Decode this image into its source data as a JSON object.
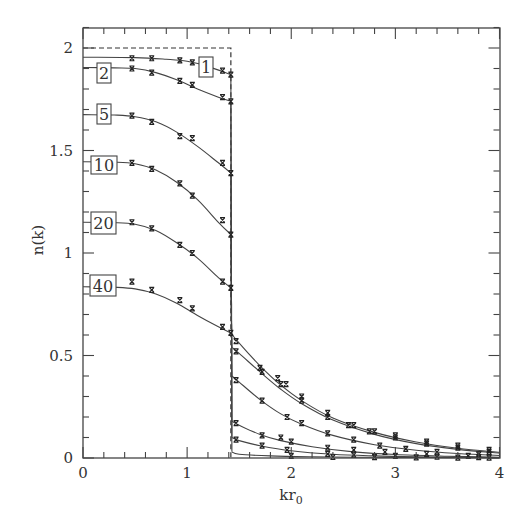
{
  "chart_data": {
    "type": "line",
    "title": "",
    "xlabel": "kr0",
    "xlabel_main": "kr",
    "xlabel_sub": "0",
    "ylabel": "n(k)",
    "xlim": [
      0,
      4
    ],
    "ylim": [
      0,
      2.1
    ],
    "grid": false,
    "legend": "inline boxed labels at left of each curve",
    "x_ticks": [
      0,
      1,
      2,
      3,
      4
    ],
    "x_tick_labels": [
      "0",
      "1",
      "2",
      "3",
      "4"
    ],
    "y_ticks": [
      0,
      0.5,
      1,
      1.5,
      2
    ],
    "y_tick_labels": [
      "0",
      "0.5",
      "1",
      "1.5",
      "2"
    ],
    "x_minor_step": 0.2,
    "y_minor_step": 0.1,
    "reference_step": {
      "description": "dashed step function (free Fermi distribution)",
      "height": 2.0,
      "kF": 1.42
    },
    "series": [
      {
        "name": "1",
        "label_pos": {
          "x": 199,
          "y": 57,
          "w": 14,
          "h": 20
        },
        "curve_below": [
          [
            0,
            1.955
          ],
          [
            0.5,
            1.953
          ],
          [
            0.8,
            1.945
          ],
          [
            1.0,
            1.935
          ],
          [
            1.2,
            1.91
          ],
          [
            1.42,
            1.87
          ]
        ],
        "curve_above": [
          [
            1.43,
            0.03
          ],
          [
            1.5,
            0.018
          ],
          [
            1.8,
            0.01
          ],
          [
            2.2,
            0.006
          ],
          [
            2.6,
            0.004
          ],
          [
            3.0,
            0.003
          ],
          [
            3.5,
            0.002
          ],
          [
            4.0,
            0.001
          ]
        ],
        "points": [
          [
            0.47,
            1.95
          ],
          [
            0.66,
            1.95
          ],
          [
            0.93,
            1.94
          ],
          [
            1.05,
            1.93
          ],
          [
            1.34,
            1.89
          ],
          [
            1.42,
            1.87
          ],
          [
            2.0,
            0.01
          ],
          [
            2.4,
            0.005
          ],
          [
            2.8,
            0.004
          ],
          [
            3.2,
            0.003
          ],
          [
            3.6,
            0.002
          ],
          [
            3.9,
            0.002
          ]
        ]
      },
      {
        "name": "2",
        "label_pos": {
          "x": 97,
          "y": 63,
          "w": 14,
          "h": 20
        },
        "curve_below": [
          [
            0,
            1.905
          ],
          [
            0.3,
            1.903
          ],
          [
            0.5,
            1.9
          ],
          [
            0.7,
            1.88
          ],
          [
            0.9,
            1.845
          ],
          [
            1.1,
            1.8
          ],
          [
            1.3,
            1.76
          ],
          [
            1.42,
            1.74
          ]
        ],
        "curve_above": [
          [
            1.43,
            0.1
          ],
          [
            1.5,
            0.085
          ],
          [
            1.7,
            0.06
          ],
          [
            2.0,
            0.035
          ],
          [
            2.4,
            0.018
          ],
          [
            2.8,
            0.01
          ],
          [
            3.2,
            0.006
          ],
          [
            3.6,
            0.004
          ],
          [
            4.0,
            0.002
          ]
        ],
        "points": [
          [
            0.47,
            1.9
          ],
          [
            0.66,
            1.88
          ],
          [
            0.93,
            1.84
          ],
          [
            1.05,
            1.82
          ],
          [
            1.34,
            1.76
          ],
          [
            1.42,
            1.74
          ],
          [
            1.47,
            0.09
          ],
          [
            1.72,
            0.06
          ],
          [
            1.96,
            0.04
          ],
          [
            2.35,
            0.02
          ],
          [
            2.6,
            0.015
          ],
          [
            3.0,
            0.01
          ],
          [
            3.4,
            0.006
          ],
          [
            3.8,
            0.004
          ]
        ]
      },
      {
        "name": "5",
        "label_pos": {
          "x": 97,
          "y": 104,
          "w": 14,
          "h": 20
        },
        "curve_below": [
          [
            0,
            1.675
          ],
          [
            0.3,
            1.673
          ],
          [
            0.5,
            1.665
          ],
          [
            0.7,
            1.64
          ],
          [
            0.9,
            1.59
          ],
          [
            1.1,
            1.52
          ],
          [
            1.3,
            1.44
          ],
          [
            1.42,
            1.39
          ]
        ],
        "curve_above": [
          [
            1.43,
            0.18
          ],
          [
            1.5,
            0.16
          ],
          [
            1.7,
            0.115
          ],
          [
            1.9,
            0.085
          ],
          [
            2.2,
            0.055
          ],
          [
            2.6,
            0.03
          ],
          [
            3.0,
            0.017
          ],
          [
            3.5,
            0.009
          ],
          [
            4.0,
            0.004
          ]
        ],
        "points": [
          [
            0.47,
            1.67
          ],
          [
            0.66,
            1.64
          ],
          [
            0.93,
            1.57
          ],
          [
            1.05,
            1.56
          ],
          [
            1.34,
            1.44
          ],
          [
            1.42,
            1.39
          ],
          [
            1.47,
            0.17
          ],
          [
            1.72,
            0.11
          ],
          [
            1.9,
            0.1
          ],
          [
            2.0,
            0.08
          ],
          [
            2.35,
            0.05
          ],
          [
            2.6,
            0.04
          ],
          [
            2.9,
            0.03
          ],
          [
            3.3,
            0.02
          ],
          [
            3.7,
            0.01
          ]
        ]
      },
      {
        "name": "10",
        "label_pos": {
          "x": 91,
          "y": 156,
          "w": 26,
          "h": 18
        },
        "curve_below": [
          [
            0,
            1.445
          ],
          [
            0.3,
            1.443
          ],
          [
            0.5,
            1.435
          ],
          [
            0.7,
            1.405
          ],
          [
            0.9,
            1.345
          ],
          [
            1.1,
            1.26
          ],
          [
            1.3,
            1.15
          ],
          [
            1.42,
            1.09
          ]
        ],
        "curve_above": [
          [
            1.43,
            0.4
          ],
          [
            1.5,
            0.37
          ],
          [
            1.7,
            0.285
          ],
          [
            1.9,
            0.215
          ],
          [
            2.1,
            0.165
          ],
          [
            2.4,
            0.11
          ],
          [
            2.8,
            0.065
          ],
          [
            3.2,
            0.038
          ],
          [
            3.6,
            0.022
          ],
          [
            4.0,
            0.012
          ]
        ],
        "points": [
          [
            0.47,
            1.44
          ],
          [
            0.66,
            1.41
          ],
          [
            0.93,
            1.34
          ],
          [
            1.05,
            1.28
          ],
          [
            1.34,
            1.16
          ],
          [
            1.42,
            1.09
          ],
          [
            1.47,
            0.38
          ],
          [
            1.72,
            0.28
          ],
          [
            1.96,
            0.2
          ],
          [
            2.1,
            0.17
          ],
          [
            2.35,
            0.12
          ],
          [
            2.6,
            0.09
          ],
          [
            2.85,
            0.06
          ],
          [
            3.1,
            0.045
          ],
          [
            3.4,
            0.03
          ],
          [
            3.8,
            0.018
          ]
        ]
      },
      {
        "name": "20",
        "label_pos": {
          "x": 91,
          "y": 212,
          "w": 25,
          "h": 22
        },
        "curve_below": [
          [
            0,
            1.15
          ],
          [
            0.3,
            1.148
          ],
          [
            0.5,
            1.14
          ],
          [
            0.7,
            1.11
          ],
          [
            0.9,
            1.05
          ],
          [
            1.1,
            0.975
          ],
          [
            1.3,
            0.88
          ],
          [
            1.42,
            0.83
          ]
        ],
        "curve_above": [
          [
            1.43,
            0.54
          ],
          [
            1.5,
            0.51
          ],
          [
            1.7,
            0.42
          ],
          [
            1.9,
            0.335
          ],
          [
            2.1,
            0.265
          ],
          [
            2.4,
            0.185
          ],
          [
            2.8,
            0.115
          ],
          [
            3.2,
            0.07
          ],
          [
            3.6,
            0.042
          ],
          [
            4.0,
            0.024
          ]
        ],
        "points": [
          [
            0.47,
            1.15
          ],
          [
            0.66,
            1.12
          ],
          [
            0.93,
            1.04
          ],
          [
            1.05,
            1.0
          ],
          [
            1.34,
            0.86
          ],
          [
            1.42,
            0.83
          ],
          [
            1.47,
            0.52
          ],
          [
            1.72,
            0.42
          ],
          [
            1.9,
            0.36
          ],
          [
            2.1,
            0.28
          ],
          [
            2.35,
            0.2
          ],
          [
            2.55,
            0.16
          ],
          [
            2.75,
            0.13
          ],
          [
            3.0,
            0.1
          ],
          [
            3.3,
            0.07
          ],
          [
            3.6,
            0.05
          ],
          [
            3.9,
            0.03
          ]
        ]
      },
      {
        "name": "40",
        "label_pos": {
          "x": 90,
          "y": 275,
          "w": 26,
          "h": 21
        },
        "curve_below": [
          [
            0,
            0.835
          ],
          [
            0.3,
            0.833
          ],
          [
            0.5,
            0.825
          ],
          [
            0.7,
            0.8
          ],
          [
            0.9,
            0.755
          ],
          [
            1.1,
            0.695
          ],
          [
            1.3,
            0.64
          ],
          [
            1.42,
            0.61
          ]
        ],
        "curve_above": [
          [
            1.42,
            0.61
          ],
          [
            1.5,
            0.56
          ],
          [
            1.7,
            0.45
          ],
          [
            1.9,
            0.355
          ],
          [
            2.1,
            0.28
          ],
          [
            2.4,
            0.195
          ],
          [
            2.8,
            0.125
          ],
          [
            3.2,
            0.078
          ],
          [
            3.6,
            0.048
          ],
          [
            4.0,
            0.028
          ]
        ],
        "points": [
          [
            0.47,
            0.86
          ],
          [
            0.66,
            0.82
          ],
          [
            0.93,
            0.77
          ],
          [
            1.05,
            0.73
          ],
          [
            1.34,
            0.64
          ],
          [
            1.42,
            0.61
          ],
          [
            1.47,
            0.57
          ],
          [
            1.7,
            0.44
          ],
          [
            1.87,
            0.39
          ],
          [
            1.95,
            0.36
          ],
          [
            2.1,
            0.3
          ],
          [
            2.35,
            0.22
          ],
          [
            2.6,
            0.16
          ],
          [
            2.8,
            0.13
          ],
          [
            3.0,
            0.11
          ],
          [
            3.3,
            0.08
          ],
          [
            3.6,
            0.06
          ],
          [
            3.9,
            0.04
          ]
        ]
      }
    ]
  }
}
